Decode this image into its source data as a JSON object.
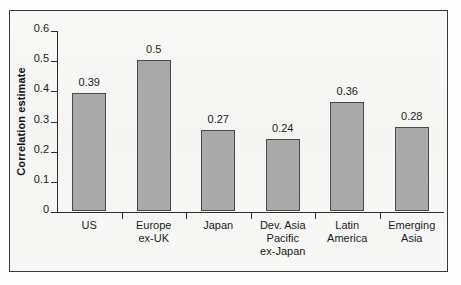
{
  "chart_data": {
    "type": "bar",
    "title": "",
    "xlabel": "",
    "ylabel": "Correlation estimate",
    "categories": [
      "US",
      "Europe\nex-UK",
      "Japan",
      "Dev. Asia\nPacific\nex-Japan",
      "Latin\nAmerica",
      "Emerging\nAsia"
    ],
    "values": [
      0.39,
      0.5,
      0.27,
      0.24,
      0.36,
      0.28
    ],
    "value_labels": [
      "0.39",
      "0.5",
      "0.27",
      "0.24",
      "0.36",
      "0.28"
    ],
    "ylim": [
      0,
      0.6
    ],
    "ytick_values": [
      0,
      0.1,
      0.2,
      0.3,
      0.4,
      0.5,
      0.6
    ],
    "ytick_labels": [
      "0",
      "0.1",
      "0.2",
      "0.3",
      "0.4",
      "0.5",
      "0.6"
    ],
    "grid": false,
    "legend": null,
    "legend_position": "none",
    "bar_fill_color": "#a9a9a9",
    "bar_edge_color": "#4a4a4a",
    "axis_color": "#2f2f2f",
    "background_color": "#f6f6f4",
    "frame_color": "#3a3a3a"
  }
}
